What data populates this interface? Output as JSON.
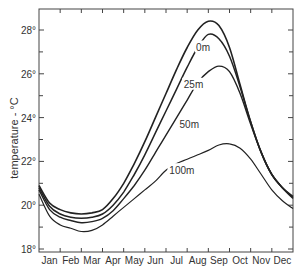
{
  "chart_data": {
    "type": "line",
    "title": "",
    "xlabel": "",
    "ylabel": "temperature - °C",
    "ylim": [
      18,
      29
    ],
    "xlim": [
      0,
      12
    ],
    "grid": false,
    "legend_position": "inline labels on curves",
    "x_tick_labels": [
      "Jan",
      "Feb",
      "Mar",
      "Apr",
      "May",
      "Jun",
      "Jul",
      "Aug",
      "Sep",
      "Oct",
      "Nov",
      "Dec"
    ],
    "y_tick_labels": [
      "18°",
      "20°",
      "22°",
      "24°",
      "26°",
      "28°"
    ],
    "y_ticks": [
      18,
      20,
      22,
      24,
      26,
      28
    ],
    "x": [
      0,
      0.5,
      1,
      1.5,
      2,
      2.5,
      3,
      3.5,
      4,
      4.5,
      5,
      5.5,
      6,
      6.5,
      7,
      7.5,
      8,
      8.5,
      9,
      9.5,
      10,
      10.5,
      11,
      11.5,
      12
    ],
    "series": [
      {
        "name": "0m",
        "label": "0m",
        "values": [
          20.9,
          20.1,
          19.8,
          19.65,
          19.6,
          19.65,
          19.8,
          20.3,
          21.0,
          21.9,
          22.9,
          24.0,
          25.1,
          26.2,
          27.2,
          28.0,
          28.4,
          28.2,
          27.2,
          25.5,
          23.8,
          22.4,
          21.4,
          20.8,
          20.4
        ]
      },
      {
        "name": "25m",
        "label": "25m",
        "values": [
          20.8,
          19.95,
          19.6,
          19.45,
          19.4,
          19.45,
          19.6,
          20.0,
          20.6,
          21.4,
          22.3,
          23.3,
          24.3,
          25.3,
          26.3,
          27.2,
          27.8,
          27.6,
          26.8,
          25.4,
          23.8,
          22.4,
          21.4,
          20.8,
          20.35
        ]
      },
      {
        "name": "50m",
        "label": "50m",
        "values": [
          20.7,
          19.8,
          19.45,
          19.3,
          19.2,
          19.25,
          19.4,
          19.75,
          20.3,
          20.9,
          21.6,
          22.4,
          23.2,
          24.0,
          24.8,
          25.6,
          26.1,
          26.35,
          26.1,
          25.1,
          23.7,
          22.4,
          21.4,
          20.8,
          20.3
        ]
      },
      {
        "name": "100m",
        "label": "100m",
        "values": [
          20.5,
          19.5,
          19.1,
          18.95,
          18.8,
          18.85,
          19.1,
          19.5,
          19.9,
          20.3,
          20.7,
          21.1,
          21.6,
          21.9,
          22.1,
          22.3,
          22.5,
          22.75,
          22.8,
          22.6,
          22.1,
          21.4,
          20.7,
          20.2,
          19.85
        ]
      }
    ],
    "annotations": [
      {
        "text": "0m",
        "month": 7.75,
        "value": 27.2
      },
      {
        "text": "25m",
        "month": 7.3,
        "value": 25.5
      },
      {
        "text": "50m",
        "month": 7.1,
        "value": 23.7
      },
      {
        "text": "100m",
        "month": 6.75,
        "value": 21.6
      }
    ]
  }
}
